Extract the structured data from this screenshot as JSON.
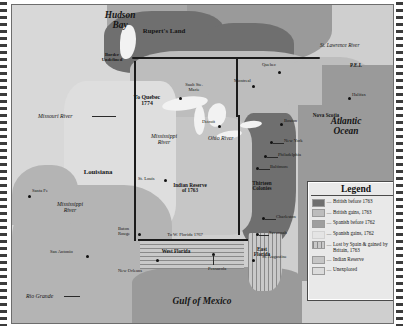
{
  "map": {
    "title": "North America after the Royal Proclamation of 1763",
    "water_labels": [
      {
        "id": "hudson-bay",
        "text": "Hudson\nBay"
      },
      {
        "id": "atlantic-ocean",
        "text": "Atlantic\nOcean"
      },
      {
        "id": "gulf-of-mexico",
        "text": "Gulf of Mexico"
      }
    ],
    "territory_labels": [
      {
        "id": "ruperts-land",
        "text": "Rupert's Land"
      },
      {
        "id": "border-undefined",
        "text": "Border\nUndefined"
      },
      {
        "id": "to-quebec-1774",
        "text": "To Quebec\n1774"
      },
      {
        "id": "louisiana",
        "text": "Louisiana"
      },
      {
        "id": "indian-reserve-1763",
        "text": "Indian Reserve\nof 1763"
      },
      {
        "id": "thirteen-colonies",
        "text": "Thirteen\nColonies"
      },
      {
        "id": "west-florida",
        "text": "West Florida"
      },
      {
        "id": "east-florida",
        "text": "East\nFlorida"
      },
      {
        "id": "to-w-florida-1767",
        "text": "To W. Florida 1767"
      },
      {
        "id": "nova-scotia",
        "text": "Nova Scotia"
      },
      {
        "id": "pei",
        "text": "P.E.I."
      }
    ],
    "river_labels": [
      {
        "id": "missouri-river",
        "text": "Missouri River"
      },
      {
        "id": "mississippi-river-north",
        "text": "Mississippi\nRiver"
      },
      {
        "id": "mississippi-river-south",
        "text": "Mississippi\nRiver"
      },
      {
        "id": "ohio-river",
        "text": "Ohio River"
      },
      {
        "id": "rio-grande",
        "text": "Rio Grande"
      },
      {
        "id": "st-lawrence-river",
        "text": "St. Lawrence River"
      }
    ],
    "cities": [
      {
        "id": "quebec",
        "text": "Quebec"
      },
      {
        "id": "montreal",
        "text": "Montreal"
      },
      {
        "id": "halifax",
        "text": "Halifax"
      },
      {
        "id": "boston",
        "text": "Boston"
      },
      {
        "id": "new-york",
        "text": "New York"
      },
      {
        "id": "philadelphia",
        "text": "Philadelphia"
      },
      {
        "id": "baltimore",
        "text": "Baltimore"
      },
      {
        "id": "charleston",
        "text": "Charleston"
      },
      {
        "id": "savannah",
        "text": "Savannah"
      },
      {
        "id": "st-augustine",
        "text": "St. Augustine"
      },
      {
        "id": "pensacola",
        "text": "Pensacola"
      },
      {
        "id": "new-orleans",
        "text": "New Orleans"
      },
      {
        "id": "baton-rouge",
        "text": "Baton\nRouge"
      },
      {
        "id": "san-antonio",
        "text": "San Antonio"
      },
      {
        "id": "santa-fe",
        "text": "Santa Fe"
      },
      {
        "id": "st-louis",
        "text": "St. Louis"
      },
      {
        "id": "detroit",
        "text": "Detroit"
      },
      {
        "id": "sault-ste-marie",
        "text": "Sault Ste.\nMarie"
      }
    ]
  },
  "legend": {
    "title": "Legend",
    "entries": [
      {
        "id": "british-before-1763",
        "label": "British before 1763",
        "color": "#6f6f6f"
      },
      {
        "id": "british-gains-1763",
        "label": "British gains, 1763",
        "color": "#bdbdbd"
      },
      {
        "id": "spanish-before-1762",
        "label": "Spanish before 1762",
        "color": "#9e9e9e"
      },
      {
        "id": "spanish-gains-1762",
        "label": "Spanish gains, 1762",
        "color": "#e4e4e4"
      },
      {
        "id": "lost-by-spain-gained-by-britain-1763",
        "label": "Lost by Spain & gained by Britain, 1763",
        "color": "#c9c9c9"
      },
      {
        "id": "indian-reserve",
        "label": "Indian Reserve",
        "color": "#c6c6c6"
      },
      {
        "id": "unexplored",
        "label": "Unexplored",
        "color": "#dcdcdc"
      }
    ]
  }
}
